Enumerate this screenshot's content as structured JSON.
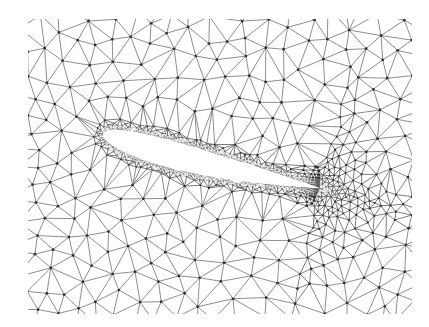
{
  "figure": {
    "kind": "unstructured-triangular-mesh",
    "subject": "airfoil",
    "title": "Unstructured triangular mesh around an airfoil",
    "caption": "",
    "width": 429,
    "height": 327,
    "background_color": "#ffffff"
  },
  "chart_data": {
    "type": "mesh",
    "title": "Unstructured triangular mesh around an airfoil",
    "xlabel": "",
    "ylabel": "",
    "grid": false,
    "legend": null,
    "annotations": [],
    "domain": {
      "x_min_px": 28,
      "x_max_px": 412,
      "y_min_px": 19,
      "y_max_px": 314,
      "shape": "rectangular-window",
      "border_drawn": false
    },
    "mesh": {
      "element_type": "triangle",
      "node_marker": "dot",
      "node_marker_color": "#2f2f2f",
      "node_marker_radius_px": 1.0,
      "edge_color": "#6a6a6a",
      "edge_color_coarse": "#7a7a7a",
      "edge_color_fine": "#5a5a5a",
      "edge_width_px": 0.55,
      "fill_color": "none",
      "approx_node_count": 9800,
      "approx_element_count": 19200,
      "refinement": "boundary-layer-graded",
      "spacing_far_field_px": 20.0,
      "spacing_near_wall_px": 1.6,
      "growth_ratio": 1.16,
      "boundary_layer_thickness_px": 26
    },
    "body": {
      "name": "airfoil",
      "section_family": "NACA 4-digit",
      "thickness_ratio": 0.12,
      "chord_px": 216,
      "angle_of_attack_deg": 14.5,
      "leading_edge_px": [
        103,
        134
      ],
      "trailing_edge_px": [
        319,
        188
      ],
      "fill_color": "#ffffff",
      "outline_color": "#ffffff",
      "outline_visible": false
    },
    "wake": {
      "present": true,
      "direction": "downstream-right",
      "refinement_decay_px": 120
    }
  }
}
